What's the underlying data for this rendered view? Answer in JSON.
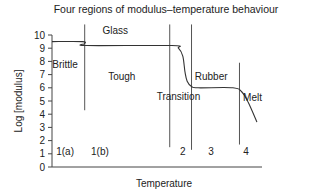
{
  "chart_data": {
    "type": "line",
    "title": "Four regions of modulus–temperature behaviour",
    "xlabel": "Temperature",
    "ylabel": "Log [modulus]",
    "ylim": [
      0,
      10
    ],
    "yticks": [
      0,
      1,
      2,
      3,
      4,
      5,
      6,
      7,
      8,
      9,
      10
    ],
    "xlim": [
      0,
      100
    ],
    "grid": false,
    "legend": "none",
    "series": [
      {
        "name": "modulus",
        "points": [
          [
            0,
            9.5
          ],
          [
            14,
            9.5
          ],
          [
            15,
            9.35
          ],
          [
            16,
            9.2
          ],
          [
            55,
            9.2
          ],
          [
            58,
            9.0
          ],
          [
            60,
            8.4
          ],
          [
            61,
            7.2
          ],
          [
            62,
            6.5
          ],
          [
            64,
            6.1
          ],
          [
            67,
            6.0
          ],
          [
            83,
            6.0
          ],
          [
            87,
            5.7
          ],
          [
            90,
            4.9
          ],
          [
            94,
            3.4
          ]
        ]
      }
    ],
    "dividers": [
      {
        "x": 15,
        "y_from": 4.3,
        "y_to": 10.8
      },
      {
        "x": 54,
        "y_from": 1.5,
        "y_to": 10.8
      },
      {
        "x": 64,
        "y_from": 1.3,
        "y_to": 10.8
      },
      {
        "x": 86,
        "y_from": 1.7,
        "y_to": 7.9
      }
    ],
    "region_labels": [
      {
        "text": "Glass",
        "x": 29,
        "y": 10.1
      },
      {
        "text": "Brittle",
        "x": 6,
        "y": 7.5
      },
      {
        "text": "Tough",
        "x": 32,
        "y": 6.6
      },
      {
        "text": "Transition",
        "x": 58,
        "y": 5.1
      },
      {
        "text": "Rubber",
        "x": 73,
        "y": 6.6
      },
      {
        "text": "Melt",
        "x": 92,
        "y": 5.0
      }
    ],
    "region_numbers": [
      {
        "text": "1(a)",
        "x": 6,
        "y": 0.9
      },
      {
        "text": "1(b)",
        "x": 22,
        "y": 0.9
      },
      {
        "text": "2",
        "x": 60,
        "y": 0.9
      },
      {
        "text": "3",
        "x": 73,
        "y": 0.9
      },
      {
        "text": "4",
        "x": 89,
        "y": 0.9
      }
    ]
  }
}
